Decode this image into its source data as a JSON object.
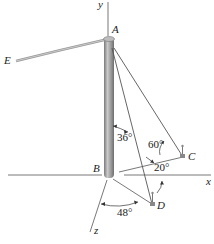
{
  "diagram": {
    "type": "3D statics figure: pole with guy cables",
    "axes": {
      "x_label": "x",
      "y_label": "y",
      "z_label": "z"
    },
    "points": {
      "A": "A",
      "B": "B",
      "C": "C",
      "D": "D",
      "E": "E"
    },
    "angles": {
      "AD_from_pole": "36°",
      "AC_from_BC": "60°",
      "BC_from_x": "20°",
      "BD_from_z": "48°"
    },
    "colors": {
      "pole": "#8a8a8a",
      "pole_highlight": "#c8c8c8",
      "cable": "#555555",
      "axis": "#444444",
      "cable_E": "#a9a9a9"
    }
  }
}
